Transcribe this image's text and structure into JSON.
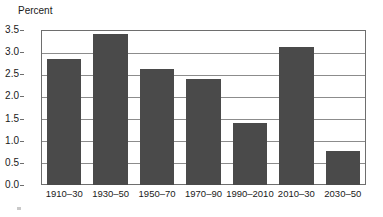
{
  "chart_data": {
    "type": "bar",
    "title": "",
    "subtitle": "",
    "xlabel": "",
    "ylabel": "Percent",
    "ylim": [
      0.0,
      3.5
    ],
    "yticks": [
      "0.0",
      "0.5",
      "1.0",
      "1.5",
      "2.0",
      "2.5",
      "3.0",
      "3.5"
    ],
    "ytick_values": [
      0.0,
      0.5,
      1.0,
      1.5,
      2.0,
      2.5,
      3.0,
      3.5
    ],
    "grid": true,
    "legend": "none",
    "bar_color": "#4a4a4a",
    "categories": [
      "1910–30",
      "1930–50",
      "1950–70",
      "1970–90",
      "1990–2010",
      "2010–30",
      "2030–50"
    ],
    "values": [
      2.85,
      3.4,
      2.62,
      2.4,
      1.4,
      3.11,
      0.77
    ],
    "annotations": []
  }
}
